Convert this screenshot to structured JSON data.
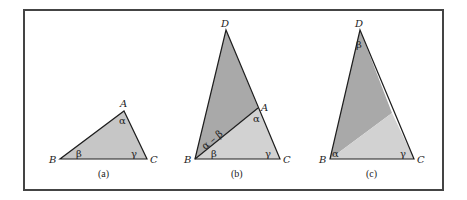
{
  "colors": {
    "frame": "#444444",
    "edge": "#1e1e1e",
    "fill_single": "#c6c6c6",
    "fill_dark": "#a9a9a9",
    "fill_light": "#d2d2d2"
  },
  "panels": [
    {
      "caption": "(a)",
      "vertices": {
        "A": "A",
        "B": "B",
        "C": "C"
      },
      "angles": {
        "at_A": "α",
        "at_B": "β",
        "at_C": "γ"
      }
    },
    {
      "caption": "(b)",
      "vertices": {
        "D": "D",
        "A": "A",
        "B": "B",
        "C": "C"
      },
      "angles": {
        "at_A": "α",
        "at_B_lower": "β",
        "at_B_upper": "α – β",
        "at_C": "γ"
      }
    },
    {
      "caption": "(c)",
      "vertices": {
        "D": "D",
        "B": "B",
        "C": "C"
      },
      "angles": {
        "at_D": "β",
        "at_B": "α",
        "at_C": "γ"
      }
    }
  ]
}
